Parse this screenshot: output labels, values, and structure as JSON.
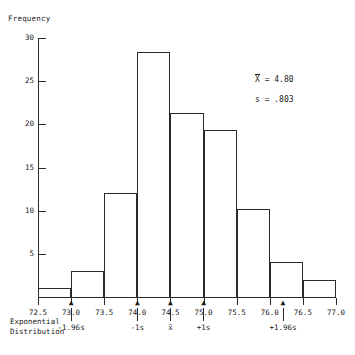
{
  "chart_data": {
    "type": "bar",
    "title": "",
    "xlabel": "",
    "ylabel": "Frequency",
    "bin_width": 0.5,
    "grid": false,
    "legend": "none",
    "xlim": [
      72.5,
      77.0
    ],
    "ylim": [
      0,
      30
    ],
    "categories": [
      "72.5-73.0",
      "73.0-73.5",
      "73.5-74.0",
      "74.0-74.5",
      "74.5-75.0",
      "75.0-75.5",
      "75.5-76.0",
      "76.0-76.5",
      "76.5-77.0"
    ],
    "bin_starts": [
      72.5,
      73.0,
      73.5,
      74.0,
      74.5,
      75.0,
      75.5,
      76.0,
      76.5
    ],
    "values": [
      1,
      3,
      12,
      28.4,
      21.3,
      19.4,
      10.2,
      4,
      2
    ],
    "xticks": [
      "72.5",
      "73.0",
      "73.5",
      "74.0",
      "74.5",
      "75.0",
      "75.5",
      "76.0",
      "76.5",
      "77.0"
    ],
    "xtick_values": [
      72.5,
      73.0,
      73.5,
      74.0,
      74.5,
      75.0,
      75.5,
      76.0,
      76.5,
      77.0
    ],
    "yticks": [
      "5",
      "10",
      "15",
      "20",
      "25",
      "30"
    ],
    "ytick_values": [
      5,
      10,
      15,
      20,
      25,
      30
    ],
    "annotations": {
      "distribution_label_line1": "Exponential",
      "distribution_label_line2": "Distribution",
      "markers": [
        {
          "label": "-1.96s",
          "value": 73.0
        },
        {
          "label": "-1s",
          "value": 74.0
        },
        {
          "label": "x̄",
          "value": 74.5
        },
        {
          "label": "+1s",
          "value": 75.0
        },
        {
          "label": "+1.96s",
          "value": 76.2
        }
      ],
      "arrow_glyph": "▲"
    }
  },
  "stats": {
    "mean_symbol": "X",
    "mean_text": "= 4.80",
    "sd_text": "s = .803"
  },
  "colors": {
    "axis": "#2a2a2a",
    "bar_stroke": "#2a2a2a",
    "background": "#ffffff",
    "text": "#1a1a1a"
  }
}
